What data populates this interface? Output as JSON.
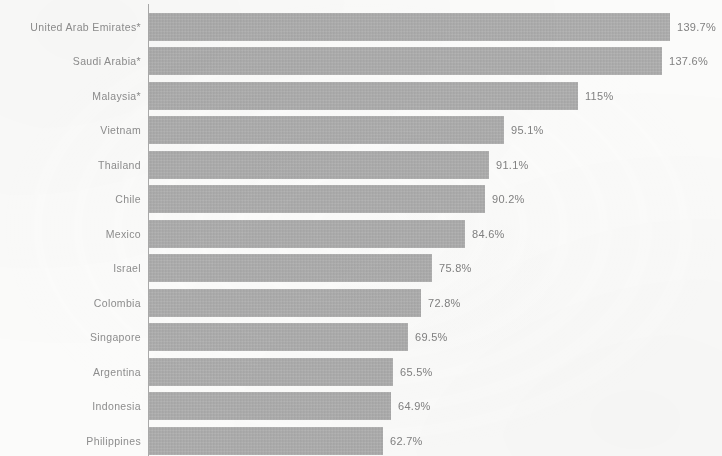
{
  "chart_data": {
    "type": "bar",
    "orientation": "horizontal",
    "title": "",
    "subtitle": "",
    "xlabel": "",
    "ylabel": "",
    "grid": false,
    "legend": null,
    "axis_line": true,
    "xlim": [
      0,
      139.7
    ],
    "value_suffix": "%",
    "note": "Chart is cropped at top and bottom; no title or axis tick labels visible.",
    "categories": [
      "United Arab Emirates*",
      "Saudi Arabia*",
      "Malaysia*",
      "Vietnam",
      "Thailand",
      "Chile",
      "Mexico",
      "Israel",
      "Colombia",
      "Singapore",
      "Argentina",
      "Indonesia",
      "Philippines"
    ],
    "values": [
      139.7,
      137.6,
      115,
      95.1,
      91.1,
      90.2,
      84.6,
      75.8,
      72.8,
      69.5,
      65.5,
      64.9,
      62.7
    ],
    "data_labels": [
      "139.7%",
      "137.6%",
      "115%",
      "95.1%",
      "91.1%",
      "90.2%",
      "84.6%",
      "75.8%",
      "72.8%",
      "69.5%",
      "65.5%",
      "64.9%",
      "62.7%"
    ],
    "colors": {
      "bar": "#a9a9a9",
      "background": "#fbfbfa",
      "category_text": "#8d8d8d",
      "value_text": "#818181",
      "axis": "#9b9b9b"
    }
  }
}
